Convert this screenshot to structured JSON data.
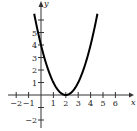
{
  "chart_data": {
    "type": "line",
    "title": "",
    "xlabel": "x",
    "ylabel": "y",
    "function": "y = (x - 2)^2",
    "series": [
      {
        "name": "parabola",
        "x": [
          -0.55,
          0,
          0.5,
          1,
          1.5,
          2,
          2.5,
          3,
          3.5,
          4,
          4.55
        ],
        "values": [
          6.5,
          4,
          2.25,
          1,
          0.25,
          0,
          0.25,
          1,
          2.25,
          4,
          6.5
        ]
      }
    ],
    "vertex": [
      2,
      0
    ],
    "xlim": [
      -2.5,
      7
    ],
    "ylim": [
      -2.5,
      7
    ],
    "x_ticks": [
      -2,
      -1,
      1,
      2,
      3,
      4,
      5,
      6
    ],
    "y_ticks": [
      -2,
      1,
      2,
      3,
      4,
      5
    ],
    "x_tick_labels": [
      "−2",
      "−1",
      "1",
      "2",
      "3",
      "4",
      "5",
      "6"
    ],
    "y_tick_labels": [
      "−2",
      "1",
      "2",
      "3",
      "4",
      "5"
    ],
    "grid": false,
    "legend": null
  },
  "colors": {
    "curve": "#000000",
    "axes": "#333333"
  }
}
